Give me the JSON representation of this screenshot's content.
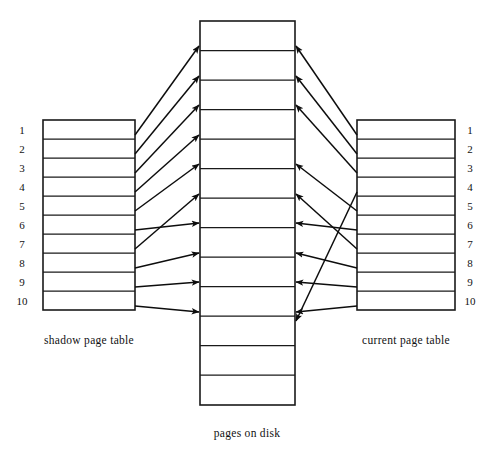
{
  "figure": {
    "title_caption_center": "pages on disk",
    "caption_left": "shadow page table",
    "caption_right": "current page table",
    "background_color": "#ffffff",
    "stroke_color": "#0d0d0d"
  },
  "left_table": {
    "name": "shadow page table",
    "caption": "shadow page table",
    "x": 43,
    "y": 120,
    "width": 92,
    "height": 190,
    "row_count": 10,
    "labels_side": "left",
    "row_labels": [
      "1",
      "2",
      "3",
      "4",
      "5",
      "6",
      "7",
      "8",
      "9",
      "10"
    ],
    "rows": [
      {
        "label": "1",
        "points_to_disk_row": 1
      },
      {
        "label": "2",
        "points_to_disk_row": 2
      },
      {
        "label": "3",
        "points_to_disk_row": 3
      },
      {
        "label": "4",
        "points_to_disk_row": 4
      },
      {
        "label": "5",
        "points_to_disk_row": 5
      },
      {
        "label": "6",
        "points_to_disk_row": 7
      },
      {
        "label": "7",
        "points_to_disk_row": 6
      },
      {
        "label": "8",
        "points_to_disk_row": 8
      },
      {
        "label": "9",
        "points_to_disk_row": 9
      },
      {
        "label": "10",
        "points_to_disk_row": 10
      }
    ]
  },
  "center_table": {
    "name": "pages on disk",
    "caption": "pages on disk",
    "x": 200,
    "y": 21,
    "width": 95,
    "height": 384,
    "row_count": 13,
    "labels_side": "none",
    "row_labels": [
      "",
      "",
      "",
      "",
      "",
      "",
      "",
      "",
      "",
      "",
      "",
      "",
      ""
    ]
  },
  "right_table": {
    "name": "current page table",
    "caption": "current page table",
    "x": 357,
    "y": 120,
    "width": 98,
    "height": 190,
    "row_count": 10,
    "labels_side": "right",
    "row_labels": [
      "1",
      "2",
      "3",
      "4",
      "5",
      "6",
      "7",
      "8",
      "9",
      "10"
    ],
    "rows": [
      {
        "label": "1",
        "points_to_disk_row": 1
      },
      {
        "label": "2",
        "points_to_disk_row": 2
      },
      {
        "label": "3",
        "points_to_disk_row": 3
      },
      {
        "label": "4",
        "points_to_disk_row": 11
      },
      {
        "label": "5",
        "points_to_disk_row": 5
      },
      {
        "label": "6",
        "points_to_disk_row": 7
      },
      {
        "label": "7",
        "points_to_disk_row": 6
      },
      {
        "label": "8",
        "points_to_disk_row": 8
      },
      {
        "label": "9",
        "points_to_disk_row": 9
      },
      {
        "label": "10",
        "points_to_disk_row": 10
      }
    ]
  }
}
